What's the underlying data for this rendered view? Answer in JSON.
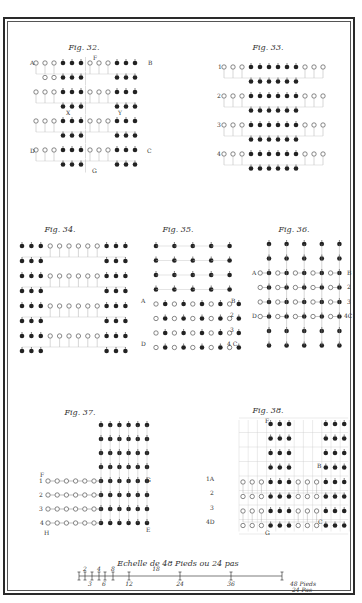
{
  "plate": {
    "border_color": "#2a2a2a",
    "ink_color": "#222222",
    "paper_color": "#ffffff"
  },
  "figures": [
    {
      "id": "fig32",
      "title": "Fig. 32.",
      "title_pos": [
        84,
        50
      ],
      "origin": [
        36,
        63
      ],
      "dx": 9,
      "dy": 14.5,
      "rows": [
        "ooo###|ooo###",
        " oo###|   ###",
        "ooo###|ooo###",
        "   ###|   ###",
        "ooo###|ooo###",
        "   ###|   ###",
        "ooo###|ooo###",
        "   ###|   ###"
      ],
      "labels": [
        {
          "text": "A",
          "x": 30,
          "y": 65
        },
        {
          "text": "B",
          "x": 148,
          "y": 65
        },
        {
          "text": "F",
          "x": 93,
          "y": 60
        },
        {
          "text": "X",
          "x": 66,
          "y": 115
        },
        {
          "text": "Y",
          "x": 118,
          "y": 115
        },
        {
          "text": "D",
          "x": 30,
          "y": 153
        },
        {
          "text": "C",
          "x": 147,
          "y": 153
        },
        {
          "text": "G",
          "x": 92,
          "y": 173
        }
      ]
    },
    {
      "id": "fig33",
      "title": "Fig. 33.",
      "title_pos": [
        268,
        50
      ],
      "origin": [
        224,
        67
      ],
      "dx": 9,
      "dy": 14.5,
      "rows": [
        "ooo######ooo",
        "   ######   ",
        "ooo######ooo",
        "   ######   ",
        "ooo######ooo",
        "   ######   ",
        "ooo######ooo",
        "   ######   "
      ],
      "labels": [
        {
          "text": "1",
          "x": 218,
          "y": 69
        },
        {
          "text": "2",
          "x": 217,
          "y": 98
        },
        {
          "text": "3",
          "x": 217,
          "y": 127
        },
        {
          "text": "4",
          "x": 217,
          "y": 156
        }
      ]
    },
    {
      "id": "fig34",
      "title": "Fig. 34.",
      "title_pos": [
        60,
        232
      ],
      "origin": [
        22,
        246
      ],
      "dx": 9.4,
      "dy": 15,
      "rows": [
        "###oooooo###",
        "###      ###",
        "###oooooo###",
        "###      ###",
        "###oooooo###",
        "###      ###",
        "###oooooo###",
        "###      ###"
      ],
      "labels": []
    },
    {
      "id": "fig35",
      "title": "Fig. 35.",
      "title_pos": [
        178,
        232
      ],
      "origin": [
        156,
        246
      ],
      "dx": 9.2,
      "dy": 14.5,
      "rows": [
        "#.#.#.#.#",
        "#.#.#.#.#",
        "#.#.#.#.#",
        "#.#.#.#.#",
        "o#o#o#o#o#",
        "o#o#o#o#o#",
        "o#o#o#o#o#",
        "o#o#o#o#o#"
      ],
      "shift_open_rows": true,
      "labels": [
        {
          "text": "A",
          "x": 141,
          "y": 303
        },
        {
          "text": "B",
          "x": 231,
          "y": 303
        },
        {
          "text": "2",
          "x": 230,
          "y": 317
        },
        {
          "text": "3",
          "x": 230,
          "y": 332
        },
        {
          "text": "D",
          "x": 141,
          "y": 346
        },
        {
          "text": "4 C",
          "x": 227,
          "y": 346
        }
      ]
    },
    {
      "id": "fig36",
      "title": "Fig. 36.",
      "title_pos": [
        294,
        232
      ],
      "origin": [
        269,
        244
      ],
      "dx": 17.6,
      "dy": 14.5,
      "rows": [
        "#####",
        "#####",
        "#####",
        "#####",
        "#####",
        "#####",
        "#####",
        "#####"
      ],
      "open_between_rows": [
        2,
        3,
        4,
        5
      ],
      "labels": [
        {
          "text": "A",
          "x": 252,
          "y": 275
        },
        {
          "text": "B",
          "x": 347,
          "y": 275
        },
        {
          "text": "2",
          "x": 347,
          "y": 289
        },
        {
          "text": "3",
          "x": 347,
          "y": 304
        },
        {
          "text": "D",
          "x": 252,
          "y": 318
        },
        {
          "text": "4C",
          "x": 344,
          "y": 318
        }
      ]
    },
    {
      "id": "fig37",
      "title": "Fig. 37.",
      "title_pos": [
        80,
        415
      ],
      "origin": [
        101,
        425
      ],
      "dx": 9.2,
      "dy": 14,
      "rows": [
        "######",
        "######",
        "######",
        "######",
        "######",
        "######",
        "######",
        "######"
      ],
      "open_tail": {
        "start_row": 4,
        "count": 6,
        "dx": 9.2,
        "x0": 48
      },
      "labels": [
        {
          "text": "F",
          "x": 40,
          "y": 477
        },
        {
          "text": "1",
          "x": 39,
          "y": 483
        },
        {
          "text": "2",
          "x": 39,
          "y": 497
        },
        {
          "text": "3",
          "x": 39,
          "y": 511
        },
        {
          "text": "4",
          "x": 40,
          "y": 525
        },
        {
          "text": "H",
          "x": 44,
          "y": 535
        },
        {
          "text": "G",
          "x": 146,
          "y": 482
        },
        {
          "text": "E",
          "x": 146,
          "y": 532
        }
      ]
    },
    {
      "id": "fig38",
      "title": "Fig. 38.",
      "title_pos": [
        268,
        413
      ],
      "origin": [
        243,
        424
      ],
      "dx": 9.2,
      "dy": 14.5,
      "rows": [
        "   ###   ###",
        "   ###   ###",
        "   ###   ###",
        "   ###   ###",
        "ooo###ooo###",
        "ooo###ooo###",
        "ooo###ooo###",
        "ooo###ooo###"
      ],
      "grid": true,
      "labels": [
        {
          "text": "F",
          "x": 265,
          "y": 423
        },
        {
          "text": "B",
          "x": 317,
          "y": 468
        },
        {
          "text": "1A",
          "x": 206,
          "y": 481
        },
        {
          "text": "2",
          "x": 210,
          "y": 495
        },
        {
          "text": "3",
          "x": 210,
          "y": 510
        },
        {
          "text": "4D",
          "x": 206,
          "y": 524
        },
        {
          "text": "C",
          "x": 318,
          "y": 524
        },
        {
          "text": "G",
          "x": 265,
          "y": 535
        }
      ]
    }
  ],
  "scale_bar": {
    "title": "Echelle de 48 Pieds ou 24 pas",
    "title_pos": [
      178,
      566
    ],
    "x0": 79,
    "x1": 282,
    "y": 576,
    "ticks_top": [
      {
        "x": 79,
        "label": ""
      },
      {
        "x": 85,
        "label": "1"
      },
      {
        "x": 92,
        "label": "2"
      },
      {
        "x": 99,
        "label": "4"
      },
      {
        "x": 105,
        "label": "5"
      },
      {
        "x": 113,
        "label": "8"
      },
      {
        "x": 129,
        "label": "12"
      },
      {
        "x": 180,
        "label": ""
      },
      {
        "x": 231,
        "label": ""
      },
      {
        "x": 282,
        "label": ""
      }
    ],
    "top_labels": [
      {
        "text": "2",
        "x": 85
      },
      {
        "text": "4",
        "x": 99
      },
      {
        "text": "8",
        "x": 113
      },
      {
        "text": "18",
        "x": 156
      }
    ],
    "bottom_labels": [
      {
        "text": "3",
        "x": 90
      },
      {
        "text": "6",
        "x": 104
      },
      {
        "text": "12",
        "x": 129
      },
      {
        "text": "24",
        "x": 180
      },
      {
        "text": "36",
        "x": 231
      },
      {
        "text": "48 Pieds",
        "x": 290
      },
      {
        "text": "24 Pas",
        "x": 292
      }
    ]
  }
}
